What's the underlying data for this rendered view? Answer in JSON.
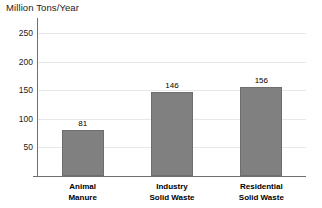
{
  "chart_data": {
    "type": "bar",
    "title": "Million Tons/Year",
    "xlabel": "",
    "ylabel": "Million Tons/Year",
    "categories": [
      "Animal Manure",
      "Industry Solid Waste",
      "Residential Solid Waste"
    ],
    "category_lines": [
      [
        "Animal",
        "Manure"
      ],
      [
        "Industry",
        "Solid Waste"
      ],
      [
        "Residential",
        "Solid Waste"
      ]
    ],
    "values": [
      81,
      146,
      156
    ],
    "value_labels": [
      "81",
      "146",
      "156"
    ],
    "ylim": [
      0,
      275
    ],
    "yticks": [
      50,
      100,
      150,
      200,
      250
    ],
    "ytick_labels": [
      "50",
      "100",
      "150",
      "200",
      "250"
    ],
    "grid": true,
    "legend": null,
    "bar_color": "#808080",
    "gridline_color": "#e8e8e8",
    "axis_color": "#6f6f6f"
  }
}
